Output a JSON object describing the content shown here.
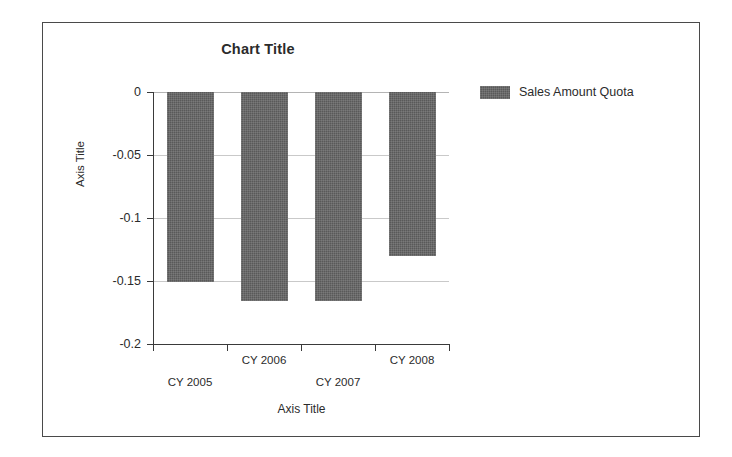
{
  "chart_data": {
    "type": "bar",
    "title": "Chart Title",
    "xlabel": "Axis Title",
    "ylabel": "Axis Title",
    "categories": [
      "CY 2005",
      "CY 2006",
      "CY 2007",
      "CY 2008"
    ],
    "series": [
      {
        "name": "Sales Amount Quota",
        "values": [
          -0.151,
          -0.166,
          -0.166,
          -0.13
        ],
        "color": "#595959"
      }
    ],
    "ylim": [
      -0.2,
      0
    ],
    "ytick_labels": [
      "0",
      "-0.05",
      "-0.1",
      "-0.15",
      "-0.2"
    ],
    "ytick_values": [
      0,
      -0.05,
      -0.1,
      -0.15,
      -0.2
    ],
    "grid": true,
    "legend_position": "right",
    "legend_entries": [
      "Sales Amount Quota"
    ],
    "category_labels_staggered": true
  },
  "legend": {
    "swatch_name": "series-color-swatch",
    "label": "Sales Amount Quota"
  },
  "frame": {
    "border_color": "#4a4a4a",
    "background": "#ffffff"
  }
}
